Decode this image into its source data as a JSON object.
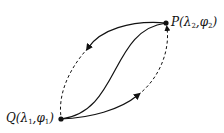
{
  "diagram": {
    "points": [
      {
        "id": "P",
        "name": "P",
        "lambda": "λ",
        "lambda_sub": "2",
        "phi": "φ",
        "phi_sub": "2",
        "x": 166,
        "y": 23
      },
      {
        "id": "Q",
        "name": "Q",
        "lambda": "λ",
        "lambda_sub": "1",
        "phi": "φ",
        "phi_sub": "1",
        "x": 61,
        "y": 119
      }
    ],
    "curves": [
      {
        "id": "upper-left-solid",
        "from": "P",
        "to": "left-mid",
        "style": "solid",
        "arrow": "toward-Q"
      },
      {
        "id": "upper-left-dashed",
        "from": "left-mid",
        "to": "Q",
        "style": "dashed"
      },
      {
        "id": "middle-s-curve",
        "from": "Q",
        "to": "P",
        "style": "solid"
      },
      {
        "id": "lower-right-solid",
        "from": "Q",
        "to": "right-mid",
        "style": "solid",
        "arrow": "toward-P"
      },
      {
        "id": "lower-right-dashed",
        "from": "right-mid",
        "to": "P",
        "style": "dashed",
        "arrow": "toward-P"
      }
    ],
    "color": "#111111"
  }
}
